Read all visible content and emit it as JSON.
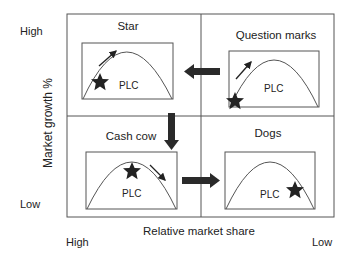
{
  "axes": {
    "y_label": "Market growth %",
    "y_high": "High",
    "y_low": "Low",
    "x_label": "Relative market share",
    "x_high": "High",
    "x_low": "Low"
  },
  "quadrants": [
    {
      "id": "star",
      "title": "Star",
      "curve_label": "PLC",
      "star_position": "early growth",
      "trend_arrow": "up-right"
    },
    {
      "id": "question-marks",
      "title": "Question marks",
      "curve_label": "PLC",
      "star_position": "introduction",
      "trend_arrow": "up-right"
    },
    {
      "id": "cash-cow",
      "title": "Cash cow",
      "curve_label": "PLC",
      "star_position": "peak/maturity",
      "trend_arrow": "down-right"
    },
    {
      "id": "dogs",
      "title": "Dogs",
      "curve_label": "PLC",
      "star_position": "decline",
      "trend_arrow": "none"
    }
  ],
  "flows": [
    {
      "from": "Question marks",
      "to": "Star",
      "direction": "left"
    },
    {
      "from": "Star",
      "to": "Cash cow",
      "direction": "down"
    },
    {
      "from": "Cash cow",
      "to": "Dogs",
      "direction": "right"
    }
  ],
  "colors": {
    "line": "#555555",
    "fill": "#222222",
    "text": "#222222"
  }
}
